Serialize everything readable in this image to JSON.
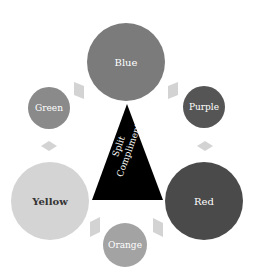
{
  "diagram": {
    "center": {
      "label_line1": "Split",
      "label_line2": "Compliment",
      "fill": "#000000",
      "text_color": "#ffffff"
    },
    "nodes": [
      {
        "id": "blue",
        "label": "Blue",
        "fill": "#7b7b7b",
        "text_color": "#ffffff",
        "cx": 126,
        "cy": 62,
        "r": 39
      },
      {
        "id": "green",
        "label": "Green",
        "fill": "#8a8a8a",
        "text_color": "#ffffff",
        "cx": 49,
        "cy": 108,
        "r": 21
      },
      {
        "id": "purple",
        "label": "Purple",
        "fill": "#555555",
        "text_color": "#ffffff",
        "cx": 204,
        "cy": 107,
        "r": 21
      },
      {
        "id": "yellow",
        "label": "Yellow",
        "fill": "#d4d4d4",
        "text_color": "#333333",
        "cx": 50,
        "cy": 201,
        "r": 39
      },
      {
        "id": "red",
        "label": "Red",
        "fill": "#4a4a4a",
        "text_color": "#ffffff",
        "cx": 204,
        "cy": 201,
        "r": 39
      },
      {
        "id": "orange",
        "label": "Orange",
        "fill": "#a3a3a3",
        "text_color": "#ffffff",
        "cx": 125,
        "cy": 245,
        "r": 22
      }
    ],
    "connector_color": "#d3d3d3"
  }
}
